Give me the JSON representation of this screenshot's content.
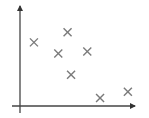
{
  "chart_data": {
    "type": "scatter",
    "title": "",
    "xlabel": "",
    "ylabel": "",
    "xlim": [
      0,
      10
    ],
    "ylim": [
      0,
      10
    ],
    "grid": false,
    "legend": null,
    "axes": {
      "x_arrow": true,
      "y_arrow": true,
      "tick_labels": false,
      "color": "#444444"
    },
    "marker": {
      "shape": "x",
      "color": "#7a7a7a",
      "size_px": 8
    },
    "series": [
      {
        "name": "points",
        "x": [
          1.2,
          4.1,
          3.3,
          5.8,
          4.4,
          6.9,
          9.3
        ],
        "y": [
          6.3,
          7.3,
          5.2,
          5.4,
          3.1,
          0.8,
          1.4
        ]
      }
    ]
  }
}
